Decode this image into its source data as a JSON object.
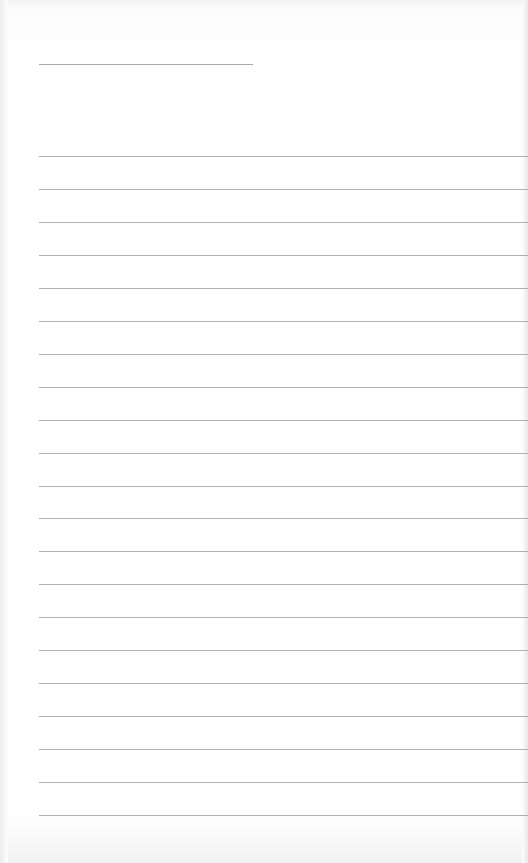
{
  "page": {
    "type": "lined-paper",
    "name_line": {
      "x": 39,
      "y": 64,
      "width": 214
    },
    "rules": {
      "count": 21,
      "first_y": 156,
      "spacing": 32.95,
      "left": 39
    },
    "colors": {
      "paper": "#fdfdfd",
      "rule": "#b0b0b0"
    }
  }
}
